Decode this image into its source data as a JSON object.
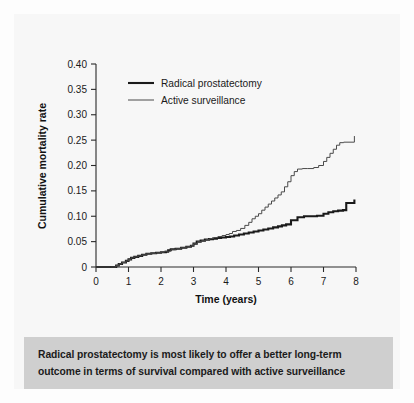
{
  "figure": {
    "background_color": "#f7f7f7",
    "caption_band_color": "#cfcfcf"
  },
  "caption": {
    "line1": "Radical prostatectomy is most likely to offer a better long-term",
    "line2": "outcome in terms of survival compared with active surveillance"
  },
  "chart_data": {
    "type": "line",
    "title": "",
    "xlabel": "Time (years)",
    "ylabel": "Cumulative mortality rate",
    "xlim": [
      0,
      8
    ],
    "ylim": [
      0,
      0.4
    ],
    "xticks": [
      0,
      1,
      2,
      3,
      4,
      5,
      6,
      7,
      8
    ],
    "xticklabels": [
      "0",
      "1",
      "2",
      "3",
      "4",
      "5",
      "6",
      "7",
      "8"
    ],
    "yticks": [
      0,
      0.05,
      0.1,
      0.15,
      0.2,
      0.25,
      0.3,
      0.35,
      0.4
    ],
    "yticklabels": [
      "0",
      "0.05",
      "0.10",
      "0.15",
      "0.20",
      "0.25",
      "0.30",
      "0.35",
      "0.40"
    ],
    "grid": false,
    "legend_position": "upper left",
    "series": [
      {
        "name": "Radical prostatectomy",
        "color": "#1a1a1a",
        "line_width": 2.1,
        "style": "step",
        "x": [
          0.0,
          0.45,
          0.62,
          0.7,
          0.8,
          0.92,
          1.0,
          1.08,
          1.18,
          1.3,
          1.42,
          1.55,
          1.7,
          1.85,
          2.0,
          2.15,
          2.22,
          2.3,
          2.45,
          2.62,
          2.78,
          2.92,
          3.0,
          3.1,
          3.22,
          3.35,
          3.48,
          3.6,
          3.72,
          3.85,
          4.0,
          4.12,
          4.25,
          4.4,
          4.55,
          4.7,
          4.85,
          5.0,
          5.15,
          5.3,
          5.45,
          5.6,
          5.72,
          5.85,
          6.0,
          6.2,
          6.4,
          6.6,
          6.8,
          7.0,
          7.15,
          7.3,
          7.45,
          7.6,
          7.7,
          7.95
        ],
        "y": [
          0.0,
          0.0,
          0.003,
          0.006,
          0.009,
          0.012,
          0.015,
          0.018,
          0.02,
          0.022,
          0.024,
          0.026,
          0.027,
          0.028,
          0.029,
          0.03,
          0.033,
          0.035,
          0.036,
          0.038,
          0.04,
          0.042,
          0.046,
          0.05,
          0.052,
          0.054,
          0.055,
          0.056,
          0.057,
          0.058,
          0.059,
          0.06,
          0.062,
          0.064,
          0.066,
          0.068,
          0.07,
          0.072,
          0.074,
          0.076,
          0.078,
          0.08,
          0.082,
          0.084,
          0.092,
          0.098,
          0.1,
          0.1,
          0.101,
          0.105,
          0.108,
          0.11,
          0.111,
          0.112,
          0.126,
          0.133
        ]
      },
      {
        "name": "Active surveillance",
        "color": "#4a4a4a",
        "line_width": 1.0,
        "style": "step",
        "x": [
          0.0,
          0.45,
          0.62,
          0.7,
          0.8,
          0.92,
          1.0,
          1.08,
          1.18,
          1.3,
          1.42,
          1.55,
          1.7,
          1.85,
          2.0,
          2.1,
          2.22,
          2.3,
          2.45,
          2.62,
          2.78,
          2.92,
          3.0,
          3.12,
          3.25,
          3.38,
          3.5,
          3.62,
          3.75,
          3.88,
          4.0,
          4.1,
          4.2,
          4.32,
          4.45,
          4.58,
          4.7,
          4.8,
          4.9,
          5.0,
          5.1,
          5.2,
          5.3,
          5.4,
          5.5,
          5.6,
          5.7,
          5.8,
          5.9,
          6.0,
          6.1,
          6.2,
          6.35,
          6.5,
          6.7,
          6.85,
          7.0,
          7.1,
          7.2,
          7.3,
          7.4,
          7.5,
          7.62,
          7.95
        ],
        "y": [
          0.0,
          0.0,
          0.003,
          0.006,
          0.009,
          0.012,
          0.015,
          0.018,
          0.02,
          0.022,
          0.024,
          0.026,
          0.027,
          0.028,
          0.029,
          0.031,
          0.031,
          0.034,
          0.036,
          0.038,
          0.04,
          0.042,
          0.046,
          0.05,
          0.052,
          0.054,
          0.056,
          0.058,
          0.06,
          0.062,
          0.064,
          0.066,
          0.07,
          0.072,
          0.076,
          0.082,
          0.088,
          0.095,
          0.1,
          0.105,
          0.112,
          0.118,
          0.124,
          0.13,
          0.136,
          0.142,
          0.148,
          0.158,
          0.168,
          0.18,
          0.188,
          0.193,
          0.194,
          0.194,
          0.196,
          0.2,
          0.208,
          0.216,
          0.224,
          0.232,
          0.24,
          0.245,
          0.246,
          0.258
        ]
      }
    ]
  }
}
